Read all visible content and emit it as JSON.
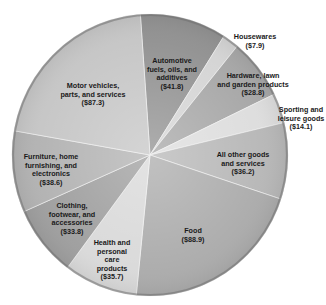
{
  "chart_data": {
    "type": "pie",
    "title": "",
    "unit": "billions of dollars",
    "center": [
      150,
      155
    ],
    "radius": [
      138,
      141
    ],
    "start_angle_deg": -4,
    "slices": [
      {
        "name": "Automotive fuels, oils, and additives",
        "label_lines": [
          "Automotive",
          "fuels, oils, and",
          "additives",
          "($41.8)"
        ],
        "value": 41.8,
        "color": "#8e8e8e",
        "label_pos": [
          172,
          74
        ]
      },
      {
        "name": "Housewares",
        "label_lines": [
          "Housewares",
          "($7.9)"
        ],
        "value": 7.9,
        "color": "#d3d3d3",
        "label_pos": [
          255,
          42
        ],
        "outside": true
      },
      {
        "name": "Hardware, lawn and garden products",
        "label_lines": [
          "Hardware, lawn",
          "and garden products",
          "($28.8)"
        ],
        "value": 28.8,
        "color": "#a4a4a4",
        "label_pos": [
          253,
          85
        ]
      },
      {
        "name": "Sporting and leisure goods",
        "label_lines": [
          "Sporting and",
          "leisure goods",
          "($14.1)"
        ],
        "value": 14.1,
        "color": "#dcdcdc",
        "label_pos": [
          301,
          119
        ],
        "outside": true
      },
      {
        "name": "All other goods and services",
        "label_lines": [
          "All other goods",
          "and services",
          "($36.2)"
        ],
        "value": 36.2,
        "color": "#b5b5b5",
        "label_pos": [
          243,
          164
        ]
      },
      {
        "name": "Food",
        "label_lines": [
          "Food",
          "($88.9)"
        ],
        "value": 88.9,
        "color": "#a9a9a9",
        "label_pos": [
          193,
          236
        ]
      },
      {
        "name": "Health and personal care products",
        "label_lines": [
          "Health and",
          "personal",
          "care",
          "products",
          "($35.7)"
        ],
        "value": 35.7,
        "color": "#d8d8d8",
        "label_pos": [
          112,
          260
        ]
      },
      {
        "name": "Clothing, footwear, and accessories",
        "label_lines": [
          "Clothing,",
          "footwear, and",
          "accessories",
          "($33.8)"
        ],
        "value": 33.8,
        "color": "#9c9c9c",
        "label_pos": [
          72,
          219
        ]
      },
      {
        "name": "Furniture, home furnishing, and electronics",
        "label_lines": [
          "Furniture, home",
          "furnishing, and",
          "electronics",
          "($38.6)"
        ],
        "value": 38.6,
        "color": "#b0b0b0",
        "label_pos": [
          51,
          170
        ]
      },
      {
        "name": "Motor vehicles, parts, and services",
        "label_lines": [
          "Motor vehicles,",
          "parts, and services",
          "($87.3)"
        ],
        "value": 87.3,
        "color": "#c4c4c4",
        "label_pos": [
          93,
          95
        ]
      }
    ],
    "legend": "none",
    "total": 413.1
  }
}
